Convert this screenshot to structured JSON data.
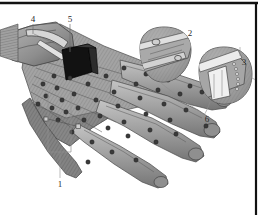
{
  "figure": {
    "kind": "patent-line-drawing",
    "view": "isometric three-quarter, back of hand",
    "background_color": "#ffffff",
    "ink_color": "#2b2b2b",
    "glove_fill": "#9b9b9b",
    "glove_shadow": "#6e6e6e",
    "glove_highlight": "#c9c9c9",
    "sensor_color": "#3a3a3a",
    "module_color": "#121212"
  },
  "borders": {
    "top_rule": {
      "visible": true,
      "color": "#111111",
      "thickness": 2
    },
    "right_rule": {
      "visible": true,
      "color": "#111111",
      "thickness": 2
    }
  },
  "reference_labels": [
    {
      "id": "1",
      "text": "1",
      "x": 60,
      "y": 184,
      "points_to": "sensor array on back of hand",
      "has_bracket": true
    },
    {
      "id": "2",
      "text": "2",
      "x": 190,
      "y": 35,
      "points_to": "fingertip closure detail inset (upper)",
      "has_bracket": false
    },
    {
      "id": "3",
      "text": "3",
      "x": 243,
      "y": 64,
      "points_to": "fingertip closure detail inset (lower)",
      "has_bracket": false
    },
    {
      "id": "4",
      "text": "4",
      "x": 32,
      "y": 21,
      "points_to": "wrist cuff strap",
      "has_bracket": false
    },
    {
      "id": "5",
      "text": "5",
      "x": 70,
      "y": 21,
      "points_to": "electronics module on cuff",
      "has_bracket": false
    },
    {
      "id": "6",
      "text": "6",
      "x": 207,
      "y": 119,
      "points_to": "index fingertip region",
      "has_bracket": false
    }
  ],
  "insets": [
    {
      "name": "inset-detail-2",
      "label": "2",
      "shape": "rounded-blob",
      "cx": 163,
      "cy": 55,
      "rx": 28,
      "ry": 27,
      "content": "finger tip with strap and buckle"
    },
    {
      "name": "inset-detail-3",
      "label": "3",
      "shape": "rounded-blob",
      "cx": 225,
      "cy": 76,
      "rx": 27,
      "ry": 28,
      "content": "finger tip with open flap and fastener teeth"
    }
  ],
  "glove": {
    "name": "sensor-glove",
    "parts": [
      {
        "name": "wrist-cuff",
        "description": "gauntlet cuff at upper-left with strap"
      },
      {
        "name": "electronics-module",
        "description": "dark rectangular module on back of cuff"
      },
      {
        "name": "back-of-hand",
        "description": "large hatched panel carrying sensor array"
      },
      {
        "name": "finger-index",
        "description": "upper long finger pointing right"
      },
      {
        "name": "finger-middle",
        "description": "second finger pointing right"
      },
      {
        "name": "finger-ring",
        "description": "third finger pointing lower-right"
      },
      {
        "name": "finger-little",
        "description": "fourth finger pointing lower-right"
      },
      {
        "name": "thumb",
        "description": "thumb angled down-left"
      }
    ],
    "sensor_count_visible": 44
  }
}
